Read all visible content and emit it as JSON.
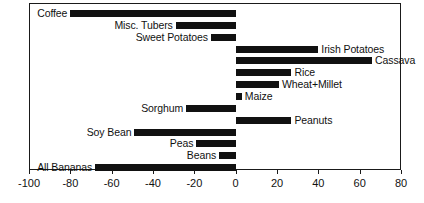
{
  "chart_data": {
    "type": "bar",
    "orientation": "horizontal",
    "title": "",
    "subtitle": "",
    "xlabel": "",
    "ylabel": "",
    "xlim": [
      -100,
      80
    ],
    "ylim": [],
    "grid": false,
    "legend": null,
    "xticks": [
      -100,
      -80,
      -60,
      -40,
      -20,
      0,
      20,
      40,
      60,
      80
    ],
    "xticklabels": [
      "-100",
      "-80",
      "-60",
      "-40",
      "-20",
      "0",
      "20",
      "40",
      "60",
      "80"
    ],
    "bar_color": "#111111",
    "frame_color": "#1a1a1a",
    "background": "#ffffff",
    "categories": [
      "Coffee",
      "Misc. Tubers",
      "Sweet Potatoes",
      "Irish Potatoes",
      "Cassava",
      "Rice",
      "Wheat+Millet",
      "Maize",
      "Sorghum",
      "Peanuts",
      "Soy Bean",
      "Peas",
      "Beans",
      "All Bananas"
    ],
    "values": [
      -80,
      -29,
      -12,
      40,
      66,
      27,
      21,
      3,
      -24,
      27,
      -49,
      -19,
      -8,
      -68
    ]
  },
  "axis": {
    "ticks": [
      {
        "value": -100,
        "label": "-100"
      },
      {
        "value": -80,
        "label": "-80"
      },
      {
        "value": -60,
        "label": "-60"
      },
      {
        "value": -40,
        "label": "-40"
      },
      {
        "value": -20,
        "label": "-20"
      },
      {
        "value": 0,
        "label": "0"
      },
      {
        "value": 20,
        "label": "20"
      },
      {
        "value": 40,
        "label": "40"
      },
      {
        "value": 60,
        "label": "60"
      },
      {
        "value": 80,
        "label": "80"
      }
    ]
  },
  "bars": [
    {
      "label": "Coffee",
      "value": -80
    },
    {
      "label": "Misc. Tubers",
      "value": -29
    },
    {
      "label": "Sweet Potatoes",
      "value": -12
    },
    {
      "label": "Irish Potatoes",
      "value": 40
    },
    {
      "label": "Cassava",
      "value": 66
    },
    {
      "label": "Rice",
      "value": 27
    },
    {
      "label": "Wheat+Millet",
      "value": 21
    },
    {
      "label": "Maize",
      "value": 3
    },
    {
      "label": "Sorghum",
      "value": -24
    },
    {
      "label": "Peanuts",
      "value": 27
    },
    {
      "label": "Soy Bean",
      "value": -49
    },
    {
      "label": "Peas",
      "value": -19
    },
    {
      "label": "Beans",
      "value": -8
    },
    {
      "label": "All Bananas",
      "value": -68
    }
  ]
}
